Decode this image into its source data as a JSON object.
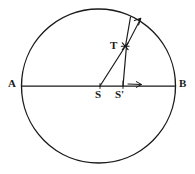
{
  "figure": {
    "type": "geometry-diagram",
    "background_color": "#ffffff",
    "stroke_color": "#1a1a1a",
    "label_color": "#1a1a1a",
    "circle": {
      "center_x": 98.5,
      "center_y": 86,
      "radius": 77,
      "stroke_width": 1.3
    },
    "labels": [
      {
        "id": "A",
        "text": "A",
        "x": 8,
        "y": 78
      },
      {
        "id": "B",
        "text": "B",
        "x": 179,
        "y": 78
      },
      {
        "id": "S",
        "text": "S",
        "x": 95,
        "y": 89
      },
      {
        "id": "Sprime",
        "text": "S'",
        "x": 115,
        "y": 89
      },
      {
        "id": "T",
        "text": "T",
        "x": 110,
        "y": 40
      }
    ],
    "points": [
      {
        "id": "A",
        "x": 22,
        "y": 86
      },
      {
        "id": "B",
        "x": 175,
        "y": 86
      },
      {
        "id": "S",
        "x": 100,
        "y": 86
      },
      {
        "id": "Sprime",
        "x": 123,
        "y": 86
      },
      {
        "id": "T",
        "x": 125,
        "y": 46
      }
    ],
    "segments": [
      {
        "id": "diameter-AB",
        "x1": 22,
        "y1": 86,
        "x2": 175,
        "y2": 86
      },
      {
        "id": "segment-S-to-T",
        "x1": 100,
        "y1": 86,
        "x2": 125,
        "y2": 46
      },
      {
        "id": "segment-Sprime-to-T",
        "x1": 123,
        "y1": 86,
        "x2": 127,
        "y2": 46
      },
      {
        "id": "segment-T-to-circle",
        "x1": 125,
        "y1": 46,
        "x2": 130,
        "y2": 17
      }
    ],
    "arrows": [
      {
        "id": "ray-from-T-arrow",
        "x1": 125,
        "y1": 46,
        "x2": 141,
        "y2": 18,
        "head": "up-right"
      },
      {
        "id": "diameter-direction-arrow",
        "x1": 128,
        "y1": 84,
        "x2": 141,
        "y2": 84,
        "head": "right"
      }
    ],
    "markers": [
      {
        "id": "T-asterisk",
        "x": 125,
        "y": 46,
        "glyph": "asterisk"
      }
    ]
  }
}
